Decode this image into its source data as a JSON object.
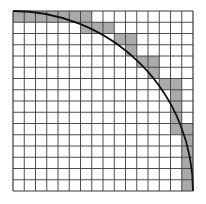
{
  "diagram": {
    "grid": {
      "rows": 16,
      "cols": 16,
      "origin_x": 13,
      "origin_y": 11,
      "cell_size": 11.25,
      "line_color": "#3a3a3a",
      "fill_color": "#ffffff"
    },
    "shaded_color": "#aaaaaa",
    "arc": {
      "center": "bottom-left corner",
      "radius_cells": 16,
      "color": "#111111",
      "width": 1.8
    },
    "shaded_cells": [
      {
        "row": 0,
        "cols": [
          0,
          1,
          2,
          3,
          4,
          5,
          6
        ]
      },
      {
        "row": 1,
        "cols": [
          6,
          7,
          8
        ]
      },
      {
        "row": 2,
        "cols": [
          9,
          10
        ]
      },
      {
        "row": 3,
        "cols": [
          10
        ]
      },
      {
        "row": 4,
        "cols": [
          11,
          12
        ]
      },
      {
        "row": 5,
        "cols": [
          12
        ]
      },
      {
        "row": 6,
        "cols": [
          13,
          14
        ]
      },
      {
        "row": 7,
        "cols": [
          14
        ]
      },
      {
        "row": 8,
        "cols": [
          14
        ]
      },
      {
        "row": 9,
        "cols": [
          14
        ]
      },
      {
        "row": 10,
        "cols": [
          14,
          15
        ]
      },
      {
        "row": 11,
        "cols": [
          15
        ]
      },
      {
        "row": 12,
        "cols": [
          15
        ]
      },
      {
        "row": 13,
        "cols": [
          15
        ]
      },
      {
        "row": 14,
        "cols": [
          15
        ]
      },
      {
        "row": 15,
        "cols": [
          15
        ]
      }
    ]
  }
}
